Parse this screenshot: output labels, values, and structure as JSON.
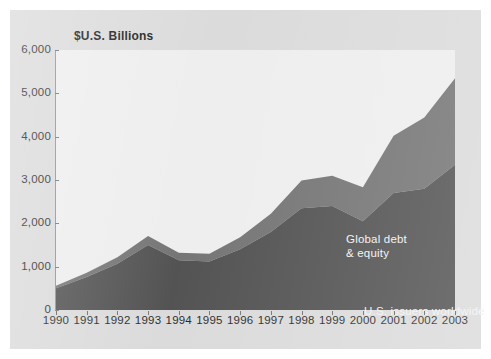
{
  "chart_data": {
    "type": "area",
    "stacked": true,
    "title": "",
    "axis_note": "$U.S. Billions",
    "xlabel": "",
    "ylabel": "$U.S. Billions",
    "grid": false,
    "legend_position": "in-plot annotations",
    "xlim": [
      1990,
      2003
    ],
    "ylim": [
      0,
      6000
    ],
    "ytick_values": [
      0,
      1000,
      2000,
      3000,
      4000,
      5000,
      6000
    ],
    "ytick_labels": [
      "0",
      "1,000",
      "2,000",
      "3,000",
      "4,000",
      "5,000",
      "6,000"
    ],
    "categories": [
      1990,
      1991,
      1992,
      1993,
      1994,
      1995,
      1996,
      1997,
      1998,
      1999,
      2000,
      2001,
      2002,
      2003
    ],
    "xtick_labels": [
      "1990",
      "1991",
      "1992",
      "1993",
      "1994",
      "1995",
      "1996",
      "1997",
      "1998",
      "1999",
      "2000",
      "2001",
      "2002",
      "2003"
    ],
    "series": [
      {
        "name": "U.S. issuers worldwide",
        "color": "#4a4a4a",
        "values": [
          500,
          760,
          1070,
          1500,
          1150,
          1120,
          1400,
          1800,
          2350,
          2400,
          2050,
          2700,
          2800,
          3350
        ]
      },
      {
        "name": "Global debt & equity",
        "color": "#6e6e6e",
        "values": [
          60,
          100,
          150,
          210,
          170,
          180,
          280,
          420,
          640,
          700,
          780,
          1320,
          1640,
          2000
        ]
      }
    ],
    "totals": [
      560,
      860,
      1220,
      1710,
      1320,
      1300,
      1680,
      2220,
      2990,
      3100,
      2830,
      4020,
      4440,
      5350
    ],
    "annotations": [
      {
        "text": "Global debt\n& equity",
        "series": "Global debt & equity"
      },
      {
        "text": "U.S. issuers worldwide",
        "series": "U.S. issuers worldwide"
      }
    ]
  },
  "colors": {
    "panel_background": "#d9d9d9",
    "plot_background": "#ededed",
    "axis": "#8e8e8e",
    "tick_text": "#1c1c1c",
    "annotation_text": "#f2f2f2",
    "lower_band": "#4a4a4a",
    "upper_band": "#6e6e6e"
  },
  "labels": {
    "axis_title": "$U.S. Billions",
    "global_debt": "Global debt\n& equity",
    "us_issuers": "U.S. issuers worldwide"
  }
}
